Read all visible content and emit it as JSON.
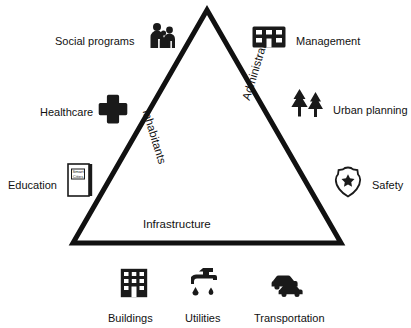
{
  "diagram": {
    "triangle": {
      "stroke_color": "#111111",
      "fill_color": "#ffffff",
      "side_labels": {
        "left": "Inhabitants",
        "right": "Administration",
        "bottom": "Infrastructure"
      }
    },
    "items": [
      {
        "id": "social-programs",
        "label": "Social programs",
        "icon": "people-group-icon"
      },
      {
        "id": "management",
        "label": "Management",
        "icon": "office-building-icon"
      },
      {
        "id": "healthcare",
        "label": "Healthcare",
        "icon": "medical-cross-icon"
      },
      {
        "id": "urban-planning",
        "label": "Urban planning",
        "icon": "trees-icon"
      },
      {
        "id": "education",
        "label": "Education",
        "icon": "book-icon"
      },
      {
        "id": "safety",
        "label": "Safety",
        "icon": "police-badge-icon"
      },
      {
        "id": "buildings",
        "label": "Buildings",
        "icon": "apartment-block-icon"
      },
      {
        "id": "utilities",
        "label": "Utilities",
        "icon": "faucet-water-icon"
      },
      {
        "id": "transportation",
        "label": "Transportation",
        "icon": "cars-icon"
      }
    ],
    "book_cover_text_line1": "Smart",
    "book_cover_text_line2": "Cities"
  }
}
